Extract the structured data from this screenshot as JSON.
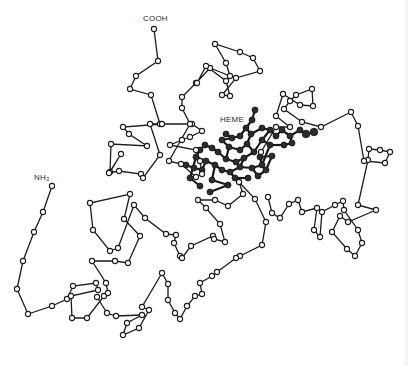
{
  "figure": {
    "labels": {
      "c_terminus": "COOH",
      "n_terminus": "NH₃",
      "heme": "HEME"
    },
    "colors": {
      "background": "#ffffff",
      "chain": "#1c1c1c",
      "heme": "#2c2c2c"
    },
    "backbone": [
      [
        154,
        29
      ],
      [
        158,
        61
      ],
      [
        136,
        76
      ],
      [
        130,
        89
      ],
      [
        151,
        95
      ],
      [
        160,
        124
      ],
      [
        162,
        124
      ],
      [
        123,
        127
      ],
      [
        129,
        134
      ],
      [
        147,
        146
      ],
      [
        111,
        144
      ],
      [
        110,
        172
      ],
      [
        121,
        154
      ],
      [
        109,
        173
      ],
      [
        119,
        171
      ],
      [
        141,
        174
      ],
      [
        143,
        178
      ],
      [
        160,
        155
      ],
      [
        150,
        124
      ],
      [
        192,
        124
      ],
      [
        202,
        131
      ],
      [
        190,
        137
      ],
      [
        182,
        140
      ],
      [
        170,
        145
      ],
      [
        196,
        150
      ],
      [
        200,
        161
      ],
      [
        202,
        174
      ],
      [
        196,
        177
      ],
      [
        181,
        164
      ],
      [
        169,
        161
      ],
      [
        190,
        124
      ],
      [
        182,
        108
      ],
      [
        182,
        97
      ],
      [
        196,
        83
      ],
      [
        210,
        68
      ],
      [
        230,
        76
      ],
      [
        226,
        63
      ],
      [
        215,
        44
      ],
      [
        240,
        52
      ],
      [
        253,
        58
      ],
      [
        260,
        71
      ],
      [
        236,
        78
      ],
      [
        222,
        95
      ],
      [
        230,
        96
      ],
      [
        226,
        81
      ],
      [
        206,
        66
      ],
      [
        197,
        83
      ]
    ],
    "chain_lower": [
      [
        52,
        186
      ],
      [
        43,
        212
      ],
      [
        34,
        232
      ],
      [
        23,
        261
      ],
      [
        17,
        289
      ],
      [
        28,
        314
      ],
      [
        52,
        306
      ],
      [
        67,
        299
      ],
      [
        73,
        286
      ],
      [
        96,
        283
      ],
      [
        98,
        290
      ],
      [
        71,
        296
      ],
      [
        72,
        318
      ],
      [
        87,
        318
      ],
      [
        104,
        296
      ],
      [
        108,
        293
      ],
      [
        106,
        283
      ],
      [
        92,
        261
      ],
      [
        115,
        261
      ],
      [
        128,
        263
      ],
      [
        140,
        236
      ],
      [
        124,
        219
      ],
      [
        130,
        194
      ],
      [
        90,
        203
      ],
      [
        93,
        230
      ],
      [
        110,
        251
      ],
      [
        118,
        248
      ],
      [
        134,
        205
      ],
      [
        145,
        218
      ],
      [
        166,
        234
      ],
      [
        176,
        235
      ],
      [
        174,
        243
      ],
      [
        180,
        256
      ],
      [
        182,
        258
      ],
      [
        191,
        246
      ],
      [
        213,
        236
      ],
      [
        214,
        239
      ],
      [
        225,
        242
      ],
      [
        220,
        224
      ],
      [
        206,
        208
      ],
      [
        198,
        200
      ],
      [
        215,
        200
      ],
      [
        228,
        206
      ],
      [
        243,
        194
      ],
      [
        239,
        182
      ],
      [
        255,
        199
      ],
      [
        266,
        222
      ],
      [
        262,
        245
      ],
      [
        240,
        256
      ],
      [
        236,
        258
      ],
      [
        217,
        272
      ],
      [
        212,
        276
      ],
      [
        200,
        283
      ],
      [
        202,
        294
      ],
      [
        195,
        296
      ],
      [
        187,
        306
      ],
      [
        180,
        319
      ],
      [
        175,
        313
      ],
      [
        168,
        300
      ],
      [
        168,
        284
      ],
      [
        162,
        273
      ],
      [
        142,
        307
      ],
      [
        149,
        310
      ],
      [
        139,
        328
      ],
      [
        123,
        335
      ],
      [
        127,
        323
      ],
      [
        142,
        315
      ],
      [
        116,
        316
      ],
      [
        107,
        313
      ],
      [
        97,
        297
      ]
    ],
    "chain_right": [
      [
        268,
        197
      ],
      [
        272,
        213
      ],
      [
        280,
        218
      ],
      [
        289,
        204
      ],
      [
        298,
        200
      ],
      [
        302,
        212
      ],
      [
        317,
        208
      ],
      [
        314,
        230
      ],
      [
        320,
        237
      ],
      [
        322,
        212
      ],
      [
        335,
        205
      ],
      [
        343,
        201
      ],
      [
        344,
        210
      ],
      [
        358,
        230
      ],
      [
        362,
        243
      ],
      [
        355,
        256
      ],
      [
        347,
        249
      ],
      [
        332,
        232
      ],
      [
        340,
        216
      ],
      [
        348,
        222
      ],
      [
        376,
        210
      ],
      [
        358,
        205
      ],
      [
        368,
        160
      ],
      [
        369,
        149
      ],
      [
        380,
        150
      ],
      [
        390,
        152
      ],
      [
        385,
        163
      ],
      [
        364,
        161
      ],
      [
        358,
        126
      ],
      [
        351,
        112
      ],
      [
        321,
        127
      ],
      [
        302,
        122
      ],
      [
        284,
        109
      ],
      [
        290,
        101
      ],
      [
        296,
        95
      ],
      [
        312,
        89
      ],
      [
        313,
        106
      ],
      [
        300,
        105
      ],
      [
        283,
        94
      ],
      [
        276,
        116
      ],
      [
        290,
        127
      ],
      [
        276,
        127
      ],
      [
        261,
        152
      ]
    ],
    "heme_atoms": [
      [
        255,
        110
      ],
      [
        252,
        120
      ],
      [
        246,
        128
      ],
      [
        240,
        136
      ],
      [
        232,
        138
      ],
      [
        226,
        134
      ],
      [
        222,
        140
      ],
      [
        229,
        147
      ],
      [
        240,
        150
      ],
      [
        247,
        144
      ],
      [
        251,
        134
      ],
      [
        262,
        128
      ],
      [
        270,
        130
      ],
      [
        276,
        136
      ],
      [
        282,
        130
      ],
      [
        290,
        136
      ],
      [
        300,
        130
      ],
      [
        306,
        134
      ],
      [
        314,
        132
      ],
      [
        292,
        143
      ],
      [
        284,
        145
      ],
      [
        270,
        145
      ],
      [
        262,
        140
      ],
      [
        254,
        152
      ],
      [
        244,
        158
      ],
      [
        236,
        162
      ],
      [
        226,
        159
      ],
      [
        218,
        152
      ],
      [
        212,
        148
      ],
      [
        205,
        145
      ],
      [
        200,
        150
      ],
      [
        196,
        157
      ],
      [
        206,
        161
      ],
      [
        215,
        165
      ],
      [
        222,
        170
      ],
      [
        230,
        172
      ],
      [
        240,
        167
      ],
      [
        252,
        168
      ],
      [
        262,
        165
      ],
      [
        258,
        176
      ],
      [
        235,
        178
      ],
      [
        212,
        180
      ],
      [
        202,
        170
      ],
      [
        194,
        168
      ],
      [
        186,
        165
      ],
      [
        190,
        178
      ],
      [
        200,
        186
      ],
      [
        260,
        157
      ],
      [
        272,
        156
      ],
      [
        266,
        170
      ],
      [
        248,
        178
      ],
      [
        228,
        185
      ],
      [
        210,
        192
      ]
    ],
    "heme_bonds": [
      [
        0,
        1
      ],
      [
        1,
        2
      ],
      [
        2,
        3
      ],
      [
        3,
        4
      ],
      [
        4,
        5
      ],
      [
        4,
        6
      ],
      [
        6,
        7
      ],
      [
        7,
        8
      ],
      [
        8,
        9
      ],
      [
        9,
        10
      ],
      [
        10,
        2
      ],
      [
        10,
        11
      ],
      [
        11,
        12
      ],
      [
        12,
        13
      ],
      [
        13,
        14
      ],
      [
        14,
        15
      ],
      [
        15,
        16
      ],
      [
        16,
        17
      ],
      [
        17,
        18
      ],
      [
        12,
        22
      ],
      [
        22,
        21
      ],
      [
        21,
        20
      ],
      [
        20,
        19
      ],
      [
        19,
        15
      ],
      [
        22,
        23
      ],
      [
        23,
        9
      ],
      [
        23,
        24
      ],
      [
        24,
        25
      ],
      [
        25,
        26
      ],
      [
        26,
        27
      ],
      [
        27,
        28
      ],
      [
        28,
        29
      ],
      [
        29,
        30
      ],
      [
        30,
        31
      ],
      [
        31,
        32
      ],
      [
        32,
        33
      ],
      [
        33,
        34
      ],
      [
        34,
        35
      ],
      [
        35,
        36
      ],
      [
        36,
        37
      ],
      [
        37,
        38
      ],
      [
        38,
        21
      ],
      [
        36,
        24
      ],
      [
        37,
        39
      ],
      [
        35,
        40
      ],
      [
        33,
        41
      ],
      [
        32,
        42
      ],
      [
        42,
        43
      ],
      [
        43,
        44
      ],
      [
        31,
        45
      ],
      [
        45,
        46
      ],
      [
        38,
        47
      ],
      [
        47,
        48
      ],
      [
        48,
        49
      ],
      [
        49,
        39
      ],
      [
        40,
        50
      ],
      [
        41,
        51
      ],
      [
        51,
        52
      ],
      [
        26,
        7
      ]
    ]
  }
}
